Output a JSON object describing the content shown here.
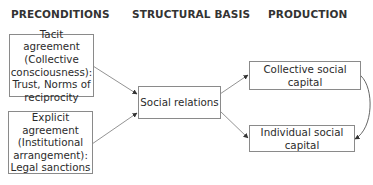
{
  "headers": {
    "preconditions": "PRECONDITIONS",
    "structural_basis": "STRUCTURAL BASIS",
    "production": "PRODUCTION"
  },
  "nodes": {
    "tacit": "Tacit agreement\n(Collective\nconsciousness):\nTrust, Norms of\nreciprocity",
    "explicit": "Explicit agreement\n(Institutional\narrangement):\nLegal sanctions",
    "social_relations": "Social relations",
    "collective": "Collective social capital",
    "individual": "Individual social capital"
  },
  "edges": [
    {
      "from": "tacit",
      "to": "social_relations",
      "type": "directed"
    },
    {
      "from": "explicit",
      "to": "social_relations",
      "type": "directed"
    },
    {
      "from": "social_relations",
      "to": "collective",
      "type": "directed"
    },
    {
      "from": "social_relations",
      "to": "individual",
      "type": "directed"
    },
    {
      "from": "collective",
      "to": "individual",
      "type": "bidirectional-curved"
    }
  ]
}
